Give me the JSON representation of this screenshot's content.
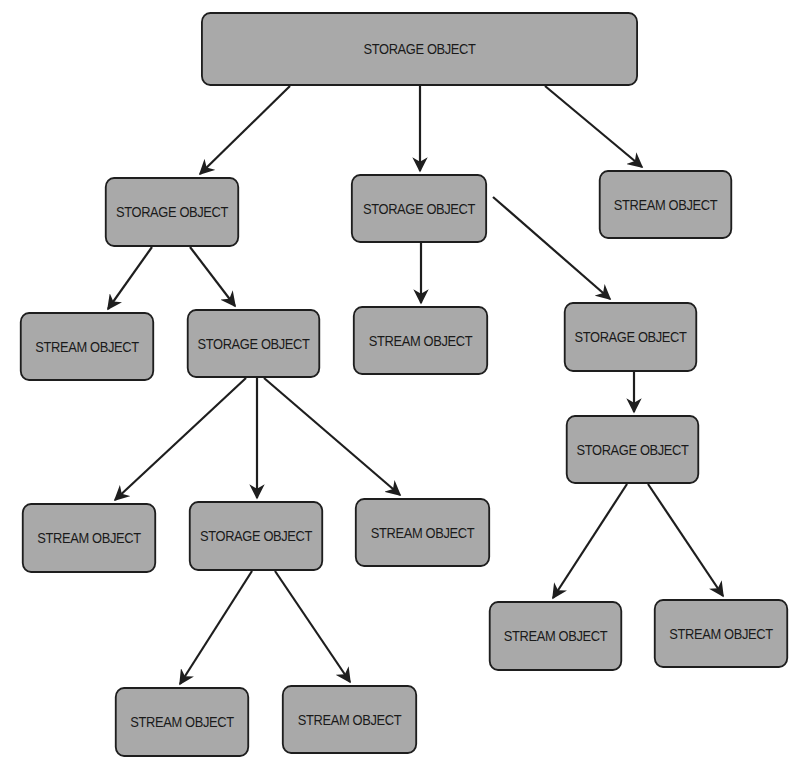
{
  "diagram": {
    "type": "tree",
    "colors": {
      "node_fill": "#a9a9a9",
      "node_border": "#1e1e1e",
      "edge": "#1e1e1e",
      "background": "#ffffff"
    },
    "nodes": [
      {
        "id": "n0",
        "label": "STORAGE OBJECT",
        "kind": "storage",
        "x": 182,
        "y": 12,
        "w": 475,
        "h": 74
      },
      {
        "id": "n1",
        "label": "STORAGE OBJECT",
        "kind": "storage",
        "x": 99,
        "y": 177,
        "w": 146,
        "h": 70
      },
      {
        "id": "n2",
        "label": "STORAGE OBJECT",
        "kind": "storage",
        "x": 345,
        "y": 174,
        "w": 148,
        "h": 69
      },
      {
        "id": "n3",
        "label": "STREAM OBJECT",
        "kind": "stream",
        "x": 593,
        "y": 170,
        "w": 145,
        "h": 69
      },
      {
        "id": "n4",
        "label": "STREAM OBJECT",
        "kind": "stream",
        "x": 14,
        "y": 312,
        "w": 146,
        "h": 69
      },
      {
        "id": "n5",
        "label": "STORAGE OBJECT",
        "kind": "storage",
        "x": 181,
        "y": 309,
        "w": 145,
        "h": 69
      },
      {
        "id": "n6",
        "label": "STREAM OBJECT",
        "kind": "stream",
        "x": 347,
        "y": 306,
        "w": 147,
        "h": 69
      },
      {
        "id": "n7",
        "label": "STORAGE OBJECT",
        "kind": "storage",
        "x": 558,
        "y": 302,
        "w": 145,
        "h": 70
      },
      {
        "id": "n8",
        "label": "STORAGE OBJECT",
        "kind": "storage",
        "x": 560,
        "y": 415,
        "w": 145,
        "h": 69
      },
      {
        "id": "n9",
        "label": "STREAM OBJECT",
        "kind": "stream",
        "x": 16,
        "y": 503,
        "w": 146,
        "h": 70
      },
      {
        "id": "n10",
        "label": "STORAGE OBJECT",
        "kind": "storage",
        "x": 183,
        "y": 501,
        "w": 146,
        "h": 70
      },
      {
        "id": "n11",
        "label": "STREAM OBJECT",
        "kind": "stream",
        "x": 349,
        "y": 498,
        "w": 147,
        "h": 69
      },
      {
        "id": "n12",
        "label": "STREAM OBJECT",
        "kind": "stream",
        "x": 109,
        "y": 687,
        "w": 146,
        "h": 70
      },
      {
        "id": "n13",
        "label": "STREAM OBJECT",
        "kind": "stream",
        "x": 276,
        "y": 685,
        "w": 147,
        "h": 69
      },
      {
        "id": "n14",
        "label": "STREAM OBJECT",
        "kind": "stream",
        "x": 483,
        "y": 601,
        "w": 145,
        "h": 70
      },
      {
        "id": "n15",
        "label": "STREAM OBJECT",
        "kind": "stream",
        "x": 648,
        "y": 599,
        "w": 146,
        "h": 69
      }
    ],
    "edges": [
      {
        "from": "n0",
        "to": "n1",
        "x1": 290,
        "y1": 86,
        "x2": 200,
        "y2": 174
      },
      {
        "from": "n0",
        "to": "n2",
        "x1": 420,
        "y1": 86,
        "x2": 420,
        "y2": 171
      },
      {
        "from": "n0",
        "to": "n3",
        "x1": 545,
        "y1": 86,
        "x2": 642,
        "y2": 167
      },
      {
        "from": "n1",
        "to": "n4",
        "x1": 152,
        "y1": 247,
        "x2": 108,
        "y2": 309
      },
      {
        "from": "n1",
        "to": "n5",
        "x1": 190,
        "y1": 247,
        "x2": 235,
        "y2": 306
      },
      {
        "from": "n2",
        "to": "n6",
        "x1": 421,
        "y1": 243,
        "x2": 421,
        "y2": 303
      },
      {
        "from": "n2",
        "to": "n7",
        "x1": 493,
        "y1": 197,
        "x2": 610,
        "y2": 299
      },
      {
        "from": "n7",
        "to": "n8",
        "x1": 634,
        "y1": 372,
        "x2": 634,
        "y2": 412
      },
      {
        "from": "n5",
        "to": "n9",
        "x1": 246,
        "y1": 378,
        "x2": 115,
        "y2": 500
      },
      {
        "from": "n5",
        "to": "n10",
        "x1": 257,
        "y1": 378,
        "x2": 257,
        "y2": 498
      },
      {
        "from": "n5",
        "to": "n11",
        "x1": 264,
        "y1": 378,
        "x2": 400,
        "y2": 495
      },
      {
        "from": "n10",
        "to": "n12",
        "x1": 252,
        "y1": 571,
        "x2": 180,
        "y2": 684
      },
      {
        "from": "n10",
        "to": "n13",
        "x1": 275,
        "y1": 571,
        "x2": 350,
        "y2": 682
      },
      {
        "from": "n8",
        "to": "n14",
        "x1": 627,
        "y1": 484,
        "x2": 553,
        "y2": 598
      },
      {
        "from": "n8",
        "to": "n15",
        "x1": 648,
        "y1": 484,
        "x2": 723,
        "y2": 596
      }
    ]
  }
}
